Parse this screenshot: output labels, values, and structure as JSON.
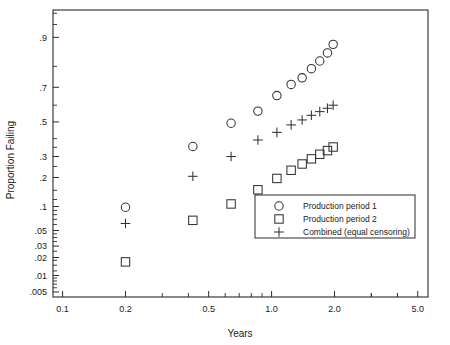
{
  "chart_data": {
    "type": "scatter",
    "title": "",
    "xlabel": "Years",
    "ylabel": "Proportion Failing",
    "xscale": "log",
    "yscale": "lognormal-probability",
    "xlim": [
      0.09,
      5.6
    ],
    "ylim": [
      0.004,
      0.955
    ],
    "grid": false,
    "legend_position": "inside-lower-right",
    "x_tick_labels": [
      "0.1",
      "0.2",
      "0.5",
      "1.0",
      "2.0",
      "5.0"
    ],
    "x_tick_values": [
      0.1,
      0.2,
      0.5,
      1.0,
      2.0,
      5.0
    ],
    "y_tick_labels": [
      ".9",
      ".7",
      ".5",
      ".3",
      ".2",
      ".1",
      ".05",
      ".03",
      ".02",
      ".01",
      ".005"
    ],
    "y_tick_values": [
      0.9,
      0.7,
      0.5,
      0.3,
      0.2,
      0.1,
      0.05,
      0.03,
      0.02,
      0.01,
      0.005
    ],
    "series": [
      {
        "name": "Production period 1",
        "marker": "circle",
        "points": [
          [
            0.2,
            0.098
          ],
          [
            0.42,
            0.355
          ],
          [
            0.64,
            0.492
          ],
          [
            0.86,
            0.565
          ],
          [
            1.06,
            0.655
          ],
          [
            1.24,
            0.715
          ],
          [
            1.4,
            0.748
          ],
          [
            1.55,
            0.79
          ],
          [
            1.7,
            0.822
          ],
          [
            1.85,
            0.852
          ],
          [
            1.97,
            0.88
          ]
        ]
      },
      {
        "name": "Production period 2",
        "marker": "square",
        "points": [
          [
            0.2,
            0.017
          ],
          [
            0.42,
            0.068
          ],
          [
            0.64,
            0.107
          ],
          [
            0.86,
            0.152
          ],
          [
            1.06,
            0.196
          ],
          [
            1.24,
            0.232
          ],
          [
            1.4,
            0.262
          ],
          [
            1.55,
            0.288
          ],
          [
            1.7,
            0.312
          ],
          [
            1.85,
            0.332
          ],
          [
            1.97,
            0.352
          ]
        ]
      },
      {
        "name": "Combined (equal censoring)",
        "marker": "plus",
        "points": [
          [
            0.2,
            0.062
          ],
          [
            0.42,
            0.205
          ],
          [
            0.64,
            0.3
          ],
          [
            0.86,
            0.392
          ],
          [
            1.06,
            0.437
          ],
          [
            1.24,
            0.482
          ],
          [
            1.4,
            0.512
          ],
          [
            1.55,
            0.54
          ],
          [
            1.7,
            0.562
          ],
          [
            1.85,
            0.582
          ],
          [
            1.97,
            0.6
          ]
        ]
      }
    ]
  },
  "legend": {
    "items": [
      {
        "marker": "circle",
        "label": "Production period 1"
      },
      {
        "marker": "square",
        "label": "Production period 2"
      },
      {
        "marker": "plus",
        "label": "Combined (equal censoring)"
      }
    ]
  },
  "axes": {
    "x_title": "Years",
    "y_title": "Proportion Failing"
  },
  "colors": {
    "line": "#2b2b2b",
    "marker": "#333333",
    "background": "#ffffff"
  }
}
